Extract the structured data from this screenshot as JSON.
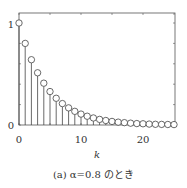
{
  "chart_data": {
    "type": "stem",
    "title": "",
    "caption": "(a) α=0.8 のとき",
    "xlabel": "k",
    "ylabel": "",
    "x": [
      0,
      1,
      2,
      3,
      4,
      5,
      6,
      7,
      8,
      9,
      10,
      11,
      12,
      13,
      14,
      15,
      16,
      17,
      18,
      19,
      20,
      21,
      22,
      23,
      24,
      25
    ],
    "values": [
      1.0,
      0.8,
      0.64,
      0.512,
      0.41,
      0.328,
      0.262,
      0.21,
      0.168,
      0.134,
      0.107,
      0.086,
      0.069,
      0.055,
      0.044,
      0.035,
      0.028,
      0.023,
      0.018,
      0.014,
      0.012,
      0.009,
      0.007,
      0.006,
      0.005,
      0.004
    ],
    "xlim": [
      0,
      25
    ],
    "ylim": [
      0,
      1.1
    ],
    "xticks": [
      "0",
      "10",
      "20"
    ],
    "yticks": [
      "0",
      "1"
    ],
    "grid": false,
    "marker": "open-circle"
  },
  "labels": {
    "xlabel": "k",
    "caption": "(a) α=0.8 のとき",
    "ytick0": "0",
    "ytick1": "1",
    "xtick0": "0",
    "xtick10": "10",
    "xtick20": "20"
  }
}
